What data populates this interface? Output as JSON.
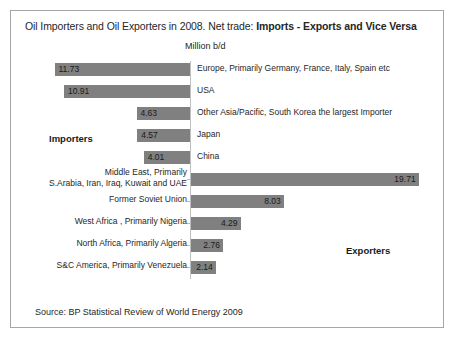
{
  "chart_title": "Oil Importers and Oil Exporters in 2008.  Net trade: ",
  "chart_title_bold": "Imports - Exports and Vice Versa",
  "axis_title": "Million b/d",
  "importers_note": "Importers",
  "exporters_note": "Exporters",
  "source": "Source: BP Statistical Review of World Energy 2009",
  "chart_data": {
    "type": "bar",
    "orientation": "horizontal",
    "layout": "diverging-tornado",
    "title": "Oil Importers and Oil Exporters in 2008.  Net trade: Imports - Exports and Vice Versa",
    "xlabel": "Million b/d",
    "ylabel": "",
    "grid": false,
    "legend": false,
    "annotations": [
      "Importers",
      "Exporters"
    ],
    "bar_color": "#808080",
    "axis_color": "#bfbfbf",
    "xlim": [
      -13,
      21
    ],
    "categories": [
      "Europe, Primarily Germany, France, Italy, Spain etc",
      "USA",
      "Other Asia/Pacific, South Korea the largest Importer",
      "Japan",
      "China",
      "Middle East, Primarily\nS.Arabia, Iran, Iraq, Kuwait and UAE",
      "Former Soviet Union",
      "West Africa , Primarily Nigeria",
      "North Africa, Primarily Algeria",
      "S&C America, Primarily Venezuela"
    ],
    "values": [
      -11.73,
      -10.91,
      -4.63,
      -4.57,
      -4.01,
      19.71,
      8.03,
      4.29,
      2.76,
      2.14
    ],
    "value_labels": [
      "11.73",
      "10.91",
      "4.63",
      "4.57",
      "4.01",
      "19.71",
      "8.03",
      "4.29",
      "2.76",
      "2.14"
    ],
    "groups": [
      "Importers",
      "Importers",
      "Importers",
      "Importers",
      "Importers",
      "Exporters",
      "Exporters",
      "Exporters",
      "Exporters",
      "Exporters"
    ],
    "label_side": [
      "right",
      "right",
      "right",
      "right",
      "right",
      "left",
      "left",
      "left",
      "left",
      "left"
    ]
  }
}
